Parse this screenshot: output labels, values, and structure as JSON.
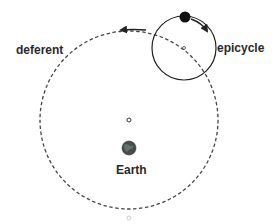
{
  "labels": {
    "deferent": "deferent",
    "epicycle": "epicycle",
    "earth": "Earth"
  },
  "colors": {
    "line": "#222222",
    "dashed": "#444444",
    "earth_fill": "#4a4a4a",
    "earth_highlight": "#6b7a70",
    "faint": "#cccccc",
    "background": "#ffffff"
  },
  "geometry": {
    "deferent": {
      "cx": 129,
      "cy": 120,
      "r": 89
    },
    "epicycle": {
      "cx": 184,
      "cy": 48,
      "r": 32
    },
    "planet": {
      "cx": 185,
      "cy": 17,
      "r": 5
    },
    "deferent_center_marker": {
      "cx": 129,
      "cy": 120,
      "r": 2
    },
    "earth": {
      "cx": 129,
      "cy": 148,
      "r": 7
    },
    "bottom_marker": {
      "cx": 129,
      "cy": 218,
      "r": 2
    }
  }
}
